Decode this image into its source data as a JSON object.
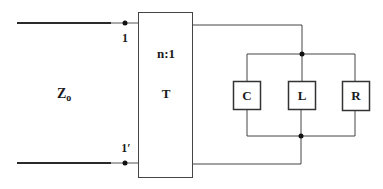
{
  "diagram": {
    "type": "circuit",
    "source": {
      "label": "Z",
      "subscript": "o"
    },
    "terminals": {
      "top": "1",
      "bottom": "1′"
    },
    "transformer": {
      "ratio": "n:1",
      "name": "T"
    },
    "components": [
      {
        "id": "capacitor",
        "label": "C"
      },
      {
        "id": "inductor",
        "label": "L"
      },
      {
        "id": "resistor",
        "label": "R"
      }
    ],
    "connection": "parallel"
  }
}
